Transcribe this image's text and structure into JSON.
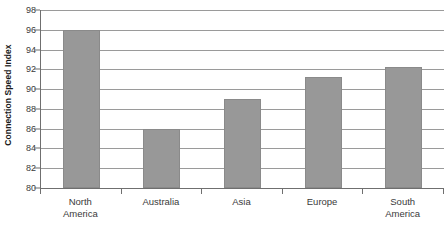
{
  "chart_data": {
    "type": "bar",
    "title": "",
    "xlabel": "",
    "ylabel": "Connection Speed Index",
    "categories": [
      "North America",
      "Australia",
      "Asia",
      "Europe",
      "South America"
    ],
    "values": [
      96,
      86,
      89,
      91.2,
      92.2
    ],
    "ylim": [
      80,
      98
    ],
    "ytick_step": 2,
    "yticks": [
      98,
      96,
      94,
      92,
      90,
      88,
      86,
      84,
      82,
      80
    ],
    "ytick_labels": [
      "98",
      "96",
      "94",
      "92",
      "90",
      "88",
      "86",
      "84",
      "82",
      "80"
    ],
    "grid": true,
    "grid_axis": "y",
    "legend": false,
    "legend_position": "none",
    "bar_color": "#989898",
    "grid_color": "#9a9a9a",
    "axis_color": "#6f6f6f",
    "text_color": "#3a3a3a",
    "background": "#ffffff",
    "category_label_lines": [
      [
        "North",
        "America"
      ],
      [
        "Australia"
      ],
      [
        "Asia"
      ],
      [
        "Europe"
      ],
      [
        "South",
        "America"
      ]
    ]
  }
}
